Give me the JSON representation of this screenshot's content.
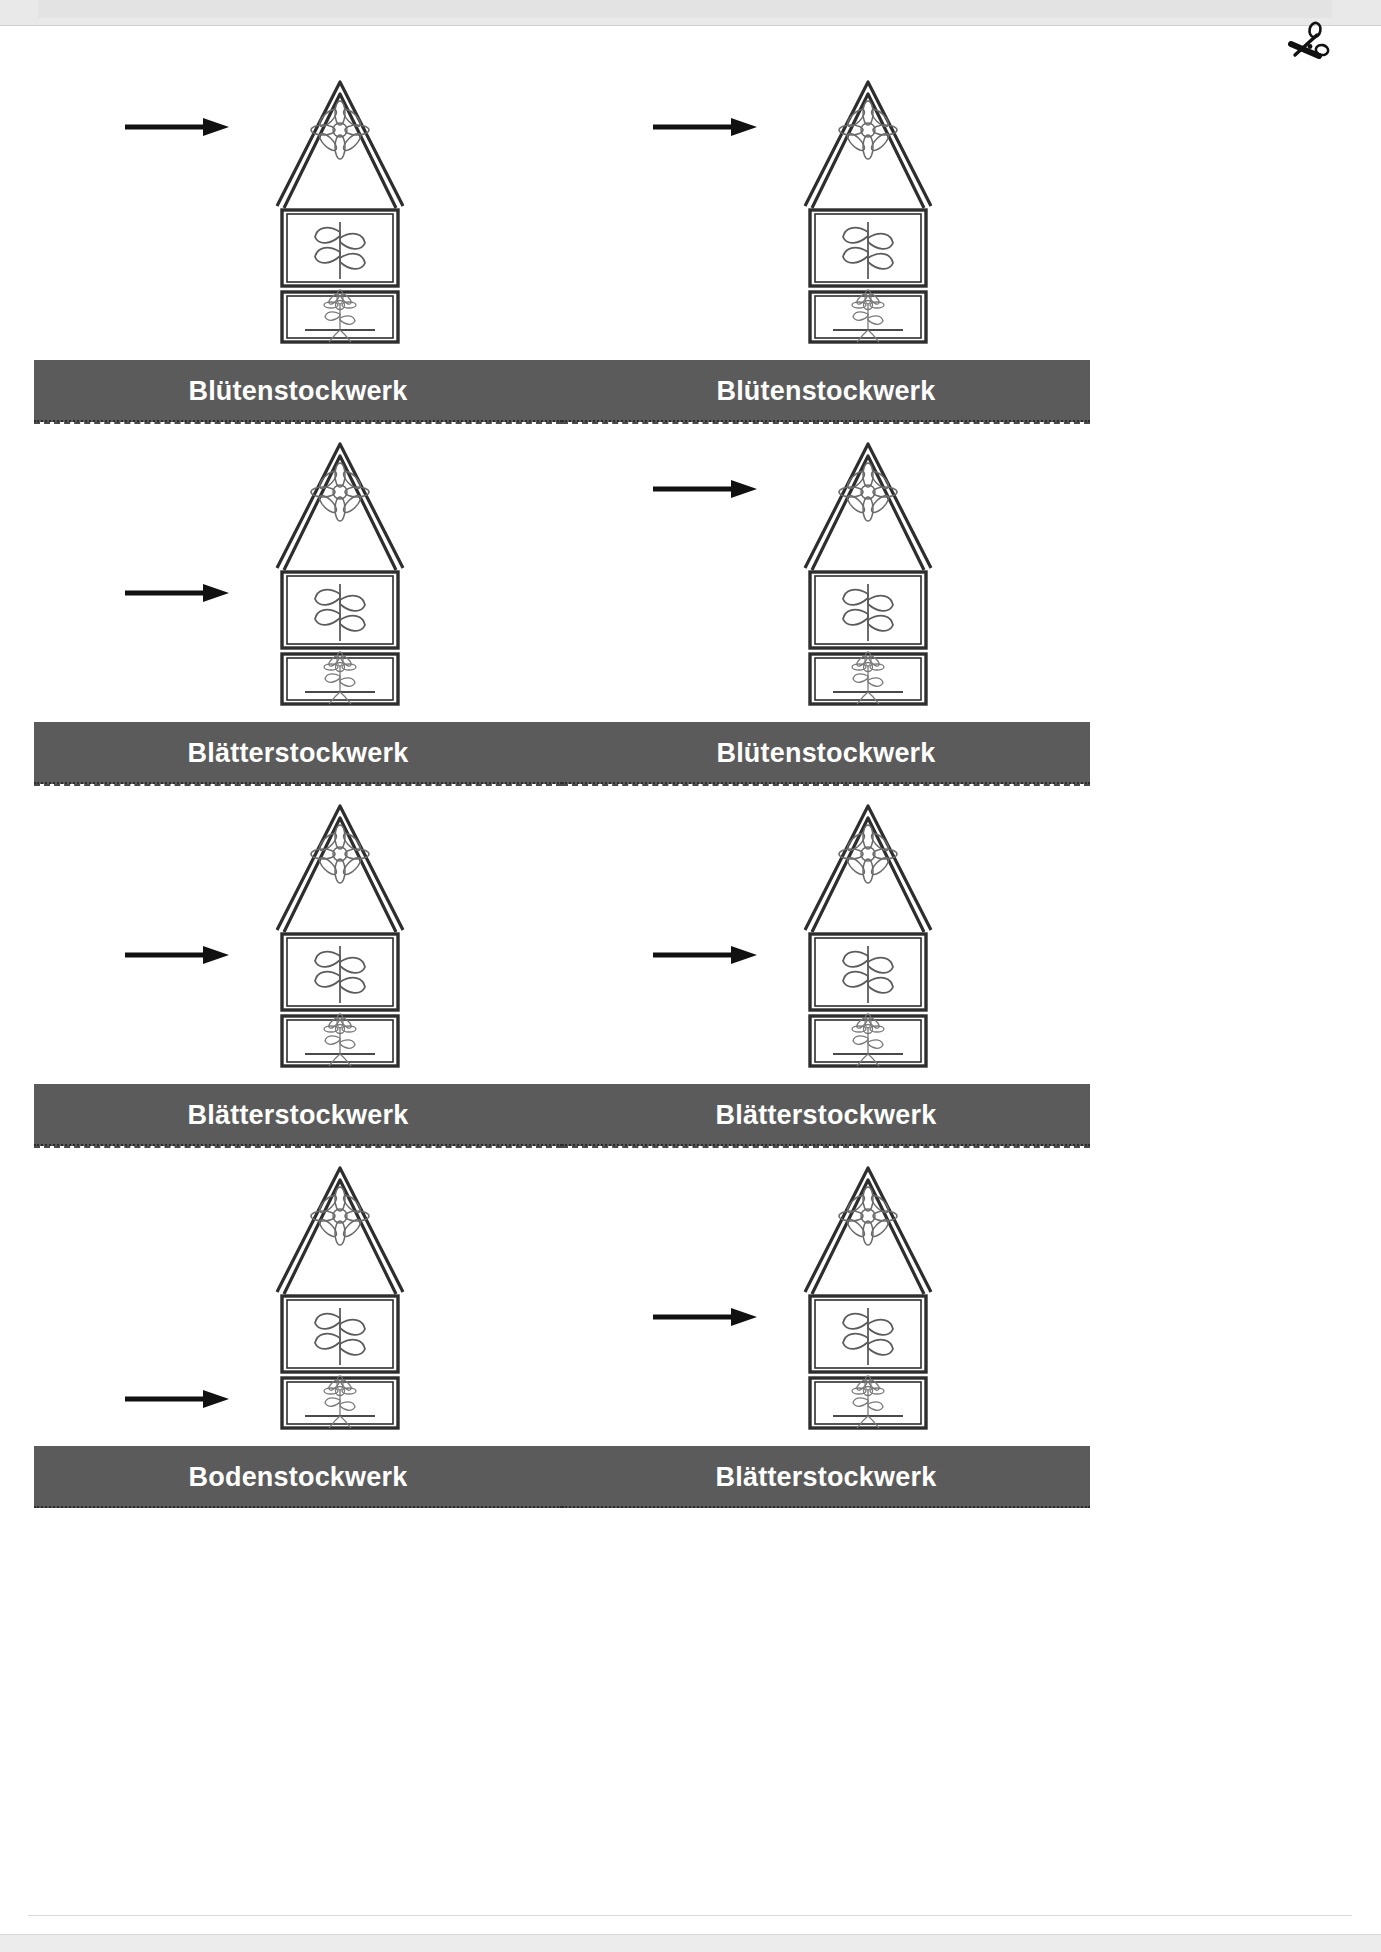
{
  "page": {
    "language": "de",
    "worksheet_type": "cut-out-cards",
    "band_color": "#5b5b5b",
    "band_text_color": "#ffffff",
    "cut_line_color": "#4a4a4a"
  },
  "icons": {
    "scissors": "scissors-icon",
    "arrow": "arrow-right-icon"
  },
  "labels": {
    "bluete": "Blütenstockwerk",
    "blaetter": "Blätterstockwerk",
    "boden": "Bodenstockwerk"
  },
  "cards": [
    {
      "id": "card-1",
      "row": 1,
      "column": "left",
      "arrow_target": "bluete",
      "label": "Blütenstockwerk"
    },
    {
      "id": "card-2",
      "row": 1,
      "column": "right",
      "arrow_target": "bluete",
      "label": "Blütenstockwerk"
    },
    {
      "id": "card-3",
      "row": 2,
      "column": "left",
      "arrow_target": "blaetter",
      "label": "Blätterstockwerk"
    },
    {
      "id": "card-4",
      "row": 2,
      "column": "right",
      "arrow_target": "bluete",
      "label": "Blütenstockwerk"
    },
    {
      "id": "card-5",
      "row": 3,
      "column": "left",
      "arrow_target": "blaetter",
      "label": "Blätterstockwerk"
    },
    {
      "id": "card-6",
      "row": 3,
      "column": "right",
      "arrow_target": "blaetter",
      "label": "Blätterstockwerk"
    },
    {
      "id": "card-7",
      "row": 4,
      "column": "left",
      "arrow_target": "boden",
      "label": "Bodenstockwerk"
    },
    {
      "id": "card-8",
      "row": 4,
      "column": "right",
      "arrow_target": "blaetter",
      "label": "Blätterstockwerk"
    }
  ],
  "house_diagram": {
    "description": "Haus der Pflanze",
    "floors": [
      {
        "name": "Blütenstockwerk",
        "position": "roof",
        "content": "flower"
      },
      {
        "name": "Blätterstockwerk",
        "position": "middle",
        "content": "leaves-on-stem"
      },
      {
        "name": "Bodenstockwerk",
        "position": "bottom",
        "content": "whole-plant-with-roots"
      }
    ]
  }
}
